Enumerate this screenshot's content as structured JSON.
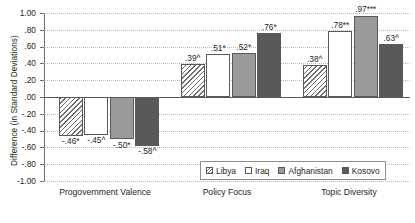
{
  "chart_data": {
    "type": "bar",
    "title": "",
    "xlabel": "",
    "ylabel": "Difference (in Standard Deviations)",
    "ylim": [
      -1.0,
      1.0
    ],
    "ytick_labels": [
      "1.00",
      ".80",
      ".60",
      ".40",
      ".20",
      ".00",
      "-.20",
      "-.40",
      "-.60",
      "-.80",
      "-1.00"
    ],
    "ytick_values": [
      1.0,
      0.8,
      0.6,
      0.4,
      0.2,
      0.0,
      -0.2,
      -0.4,
      -0.6,
      -0.8,
      -1.0
    ],
    "grid": true,
    "legend_position": "inside-bottom-right",
    "categories": [
      "Progovernment Valence",
      "Policy Focus",
      "Topic Diversity"
    ],
    "series": [
      {
        "name": "Libya",
        "color": "#ffffff",
        "pattern": "diagonal-hatch",
        "values": [
          -0.46,
          0.39,
          0.38
        ],
        "labels": [
          "-.46*",
          ".39^",
          ".38^"
        ]
      },
      {
        "name": "Iraq",
        "color": "#ffffff",
        "pattern": "solid",
        "values": [
          -0.45,
          0.51,
          0.78
        ],
        "labels": [
          "-.45^",
          ".51*",
          ".78**"
        ]
      },
      {
        "name": "Afghanistan",
        "color": "#9a9a9a",
        "pattern": "solid",
        "values": [
          -0.5,
          0.52,
          0.97
        ],
        "labels": [
          "-.50*",
          ".52*",
          ".97***"
        ]
      },
      {
        "name": "Kosovo",
        "color": "#58595b",
        "pattern": "solid",
        "values": [
          -0.58,
          0.76,
          0.63
        ],
        "labels": [
          "-.58^",
          ".76*",
          ".63^"
        ]
      }
    ]
  }
}
